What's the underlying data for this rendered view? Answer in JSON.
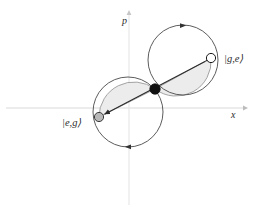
{
  "figure": {
    "type": "phase-space-diagram",
    "background": "#ffffff",
    "axes": {
      "x_label": "x",
      "p_label": "p",
      "x_axis_color": "#d8d8d8",
      "p_axis_color": "#e2e2e2",
      "origin": {
        "x": 129,
        "y": 108
      }
    },
    "states": [
      {
        "id": "state-ge",
        "label": "|g,e⟩",
        "marker": "open-circle",
        "marker_fill": "#ffffff",
        "marker_stroke": "#1a1a1a",
        "position": {
          "x": 211,
          "y": 58
        },
        "label_position": {
          "x": 224,
          "y": 61
        }
      },
      {
        "id": "state-eg",
        "label": "|e,g⟩",
        "marker": "filled-circle",
        "marker_fill": "#b8b8b8",
        "marker_stroke": "#3a3a3a",
        "position": {
          "x": 99,
          "y": 117
        },
        "label_position": {
          "x": 62,
          "y": 122
        }
      },
      {
        "id": "state-origin",
        "label": "",
        "marker": "solid-dot",
        "marker_fill": "#111111",
        "marker_stroke": "#111111",
        "position": {
          "x": 155,
          "y": 89
        }
      }
    ],
    "circles": [
      {
        "id": "upper-circle",
        "center": {
          "x": 183,
          "y": 60
        },
        "radius": 35,
        "stroke": "#4a4a4a",
        "fill": "none",
        "direction_marker_angle_deg": 250
      },
      {
        "id": "lower-circle",
        "center": {
          "x": 128,
          "y": 112
        },
        "radius": 35,
        "stroke": "#4a4a4a",
        "fill": "none",
        "direction_marker_angle_deg": 70
      }
    ],
    "shaded_regions": {
      "fill": "#ececec",
      "stroke": "#8a8a8a",
      "description": "two crescent lobes between the diagonal axis and each circle"
    },
    "arrow": {
      "id": "diagonal-arrow",
      "from": {
        "x": 211,
        "y": 58
      },
      "to": {
        "x": 99,
        "y": 117
      },
      "color": "#2a2a2a",
      "double_headed": true
    }
  }
}
